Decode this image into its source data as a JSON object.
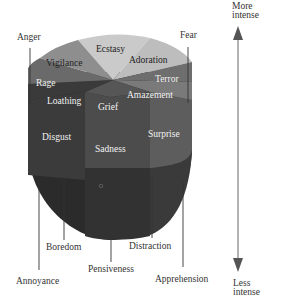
{
  "diagram": {
    "title": "",
    "intensity_axis": {
      "top_label_line1": "More",
      "top_label_line2": "intense",
      "bottom_label_line1": "Less",
      "bottom_label_line2": "intense"
    },
    "outer_labels": {
      "anger": "Anger",
      "fear": "Fear",
      "annoyance": "Annoyance",
      "boredom": "Boredom",
      "pensiveness": "Pensiveness",
      "distraction": "Distraction",
      "apprehension": "Apprehension"
    },
    "top_surface_labels": {
      "ecstasy": "Ecstasy",
      "adoration": "Adoration",
      "vigilance": "Vigilance",
      "terror": "Terror",
      "rage": "Rage",
      "amazement": "Amazement",
      "loathing": "Loathing",
      "grief": "Grief"
    },
    "side_labels": {
      "disgust": "Disgust",
      "sadness": "Sadness",
      "surprise": "Surprise"
    },
    "colors": {
      "ecstasy": "#c8c8c8",
      "adoration": "#bdbdbd",
      "vigilance": "#8e8e8e",
      "terror": "#6e6e6e",
      "rage": "#6a6a6a",
      "amazement": "#7a7a7a",
      "loathing": "#3a3a3a",
      "grief": "#555555",
      "disgust": "#3a3a3a",
      "sadness": "#4a4a4a",
      "surprise": "#5e5e5e",
      "cone_bottom": "#2a2a2a",
      "arrow": "#555555"
    }
  }
}
